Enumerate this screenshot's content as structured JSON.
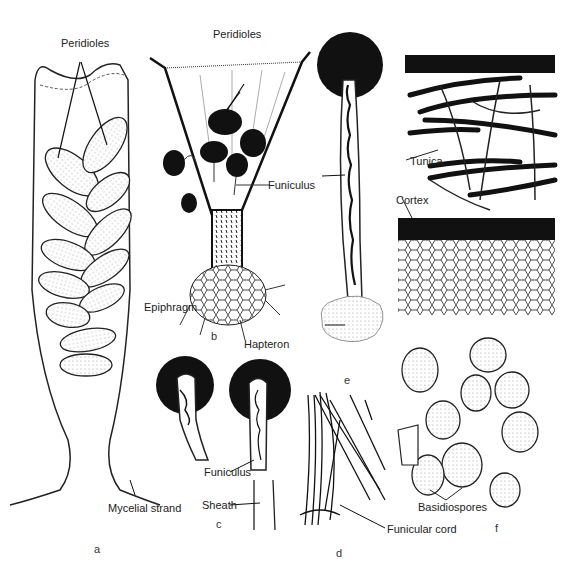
{
  "figure": {
    "panels": [
      {
        "id": "a",
        "letter": "a",
        "labels": [
          "Peridioles",
          "Mycelial strand"
        ]
      },
      {
        "id": "b",
        "letter": "b",
        "labels": [
          "Peridioles",
          "Funiculus",
          "Epiphragm"
        ]
      },
      {
        "id": "c",
        "letter": "c",
        "labels": [
          "Funiculus",
          "Sheath"
        ]
      },
      {
        "id": "d",
        "letter": "d",
        "labels": [
          "Funicular cord"
        ]
      },
      {
        "id": "e",
        "letter": "e",
        "labels": [
          "Hapteron"
        ]
      },
      {
        "id": "f",
        "letter": "f",
        "labels": [
          "Tunica",
          "Cortex",
          "Basidiospores"
        ]
      }
    ]
  },
  "labels": {
    "a_peridioles": "Peridioles",
    "a_mycelial_strand": "Mycelial strand",
    "b_peridioles": "Peridioles",
    "b_funiculus": "Funiculus",
    "b_epiphragm": "Epiphragm",
    "e_hapteron": "Hapteron",
    "c_funiculus": "Funiculus",
    "c_sheath": "Sheath",
    "d_funicular_cord": "Funicular cord",
    "f_tunica": "Tunica",
    "f_cortex": "Cortex",
    "f_basidiospores": "Basidiospores"
  },
  "letters": {
    "a": "a",
    "b": "b",
    "c": "c",
    "d": "d",
    "e": "e",
    "f": "f"
  }
}
